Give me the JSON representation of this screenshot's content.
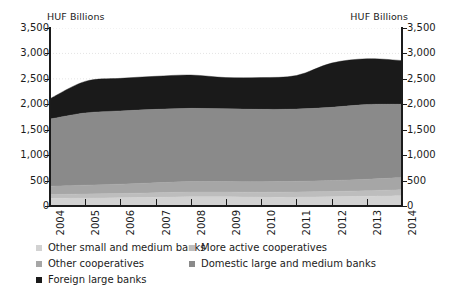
{
  "chart_data": {
    "type": "area",
    "stacked": true,
    "title": "",
    "subtitle": "",
    "xlabel": "",
    "ylabel": "HUF Billions",
    "ylabel_right": "HUF Billions",
    "unit_caption_left": "HUF Billions",
    "unit_caption_right": "HUF Billions",
    "grid": true,
    "grid_style": "faint dotted horizontal",
    "legend_position": "bottom",
    "legend_columns": 2,
    "ylim": [
      0,
      3500
    ],
    "ytick_step": 500,
    "ytick_labels": [
      "3,500",
      "3,000",
      "2,500",
      "2,000",
      "1,500",
      "1,000",
      "500",
      "0"
    ],
    "ytick_values": [
      3500,
      3000,
      2500,
      2000,
      1500,
      1000,
      500,
      0
    ],
    "ytick_labels_right": [
      "3,500",
      "3,000",
      "2,500",
      "2,000",
      "1,500",
      "1,000",
      "500",
      "0"
    ],
    "categories": [
      "2004",
      "2005",
      "2006",
      "2007",
      "2008",
      "2009",
      "2010",
      "2011",
      "2012",
      "2013",
      "2014"
    ],
    "x": [
      2004,
      2005,
      2006,
      2007,
      2008,
      2009,
      2010,
      2011,
      2012,
      2013,
      2014
    ],
    "xtick_labels": [
      "2004",
      "2005",
      "2006",
      "2007",
      "2008",
      "2009",
      "2010",
      "2011",
      "2012",
      "2013",
      "2014"
    ],
    "xtick_rotation": -90,
    "series": [
      {
        "name": "Other small and medium banks",
        "color": "#d2d2d2",
        "order": 1,
        "values": [
          150,
          155,
          160,
          170,
          180,
          180,
          175,
          175,
          180,
          190,
          200
        ]
      },
      {
        "name": "More active cooperatives",
        "color": "#bdbdbd",
        "order": 2,
        "values": [
          75,
          80,
          85,
          90,
          95,
          95,
          95,
          100,
          105,
          110,
          120
        ]
      },
      {
        "name": "Other cooperatives",
        "color": "#a6a6a6",
        "order": 3,
        "values": [
          165,
          175,
          185,
          195,
          205,
          205,
          205,
          210,
          215,
          225,
          240
        ]
      },
      {
        "name": "Domestic large and medium banks",
        "color": "#8a8a8a",
        "order": 4,
        "values": [
          1320,
          1420,
          1440,
          1445,
          1440,
          1430,
          1425,
          1420,
          1440,
          1470,
          1440
        ]
      },
      {
        "name": "Foreign large banks",
        "color": "#1a1a1a",
        "order": 5,
        "values": [
          400,
          620,
          640,
          650,
          655,
          615,
          625,
          660,
          870,
          900,
          860
        ]
      }
    ],
    "series_totals": [
      2110,
      2450,
      2510,
      2550,
      2575,
      2525,
      2525,
      2565,
      2810,
      2895,
      2860
    ]
  },
  "legend": {
    "column_a": [
      {
        "label": "Other small and medium banks",
        "color": "#d2d2d2"
      },
      {
        "label": "Other cooperatives",
        "color": "#a6a6a6"
      },
      {
        "label": "Foreign large banks",
        "color": "#1a1a1a"
      }
    ],
    "column_b": [
      {
        "label": "More active cooperatives",
        "color": "#bdbdbd"
      },
      {
        "label": "Domestic large and medium banks",
        "color": "#8a8a8a"
      }
    ]
  }
}
